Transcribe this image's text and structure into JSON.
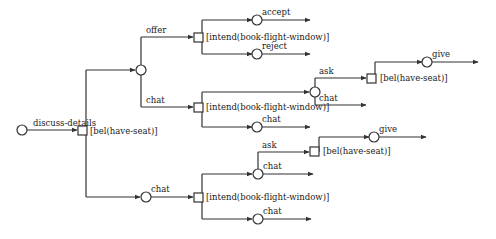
{
  "diagram": {
    "type": "dialogue-game-tree",
    "labels": {
      "discuss": "discuss-details",
      "bel_root": "[bel(have-seat)]",
      "offer": "offer",
      "chat_mid": "chat",
      "chat_bottom": "chat",
      "intend_top": "[intend(book-flight-window)]",
      "accept": "accept",
      "reject": "reject",
      "intend_mid": "[intend(book-flight-window)]",
      "ask_mid": "ask",
      "chat_mid_inner": "chat",
      "chat_mid_lower": "chat",
      "bel_mid": "[bel(have-seat)]",
      "give_mid": "give",
      "intend_bottom": "[intend(book-flight-window)]",
      "ask_bottom": "ask",
      "chat_bottom_upper": "chat",
      "chat_bottom_lower": "chat",
      "bel_bottom": "[bel(have-seat)]",
      "give_bottom": "give"
    },
    "legend": {
      "circle": "state node",
      "square": "condition / choice node"
    }
  }
}
